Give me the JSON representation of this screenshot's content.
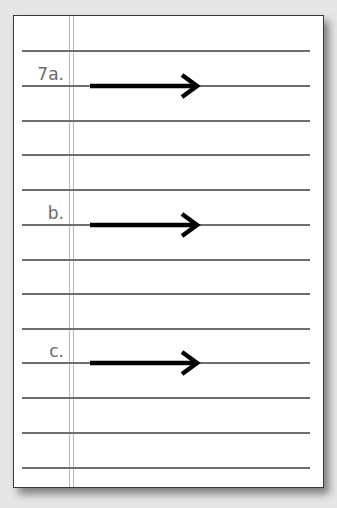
{
  "worksheet": {
    "items": [
      {
        "label": "7a.",
        "arrow": "right-arrow"
      },
      {
        "label": "b.",
        "arrow": "right-arrow"
      },
      {
        "label": "c.",
        "arrow": "right-arrow"
      }
    ],
    "rule_count": 13,
    "colors": {
      "rule": "#6e6e6e",
      "margin": "#b8b8b8",
      "arrow": "#000000",
      "label": "#6a6a6a"
    }
  }
}
